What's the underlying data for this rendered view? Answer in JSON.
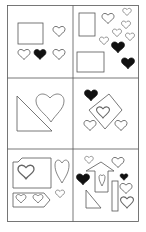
{
  "figure": {
    "colors": {
      "outline": "#555555",
      "filled_heart": "#111111",
      "background": "#ffffff"
    },
    "panels": [
      {
        "id": "panel-1",
        "row": 1,
        "col": 1,
        "shapes": [
          "rectangle",
          "heart-outline",
          "heart-outline",
          "heart-filled",
          "heart-outline"
        ],
        "filled_hearts": 1,
        "outline_hearts": 3
      },
      {
        "id": "panel-2",
        "row": 1,
        "col": 2,
        "shapes": [
          "rectangle",
          "rectangle",
          "heart-outline",
          "heart-outline",
          "heart-outline",
          "heart-outline",
          "heart-outline",
          "heart-outline",
          "heart-filled",
          "heart-filled"
        ],
        "filled_hearts": 2,
        "outline_hearts": 6
      },
      {
        "id": "panel-3",
        "row": 2,
        "col": 1,
        "shapes": [
          "right-triangle",
          "heart-outline-large"
        ],
        "filled_hearts": 0,
        "outline_hearts": 1
      },
      {
        "id": "panel-4",
        "row": 2,
        "col": 2,
        "shapes": [
          "diamond",
          "heart-outline",
          "heart-outline",
          "heart-outline",
          "heart-filled"
        ],
        "filled_hearts": 1,
        "outline_hearts": 3
      },
      {
        "id": "panel-5",
        "row": 3,
        "col": 1,
        "shapes": [
          "pentagon-tag",
          "pentagon-tag",
          "heart-outline",
          "heart-outline",
          "heart-outline",
          "heart-outline",
          "heart-outline"
        ],
        "filled_hearts": 0,
        "outline_hearts": 5
      },
      {
        "id": "panel-6",
        "row": 3,
        "col": 2,
        "shapes": [
          "arrow-house",
          "right-triangle",
          "rectangle",
          "heart-outline",
          "heart-outline",
          "heart-outline",
          "heart-outline",
          "heart-outline",
          "heart-filled",
          "heart-filled"
        ],
        "filled_hearts": 2,
        "outline_hearts": 5
      }
    ]
  }
}
